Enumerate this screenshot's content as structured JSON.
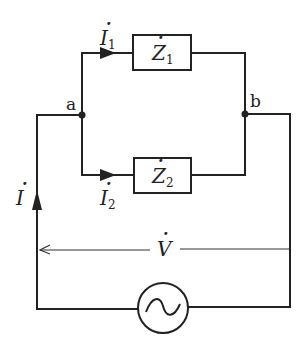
{
  "diagram": {
    "type": "circuit",
    "title": "",
    "nodes": [
      {
        "id": "a",
        "label": "a"
      },
      {
        "id": "b",
        "label": "b"
      }
    ],
    "components": [
      {
        "id": "Z1",
        "type": "impedance",
        "label": "Z",
        "subscript": "1",
        "dotted": true,
        "between": [
          "a",
          "b"
        ],
        "branch": "upper"
      },
      {
        "id": "Z2",
        "type": "impedance",
        "label": "Z",
        "subscript": "2",
        "dotted": true,
        "between": [
          "a",
          "b"
        ],
        "branch": "lower"
      },
      {
        "id": "src",
        "type": "ac-voltage-source",
        "symbol": "~"
      }
    ],
    "currents": [
      {
        "id": "I",
        "label": "I",
        "subscript": "",
        "direction": "up",
        "location": "left outer wire"
      },
      {
        "id": "I1",
        "label": "I",
        "subscript": "1",
        "direction": "right",
        "location": "upper branch"
      },
      {
        "id": "I2",
        "label": "I",
        "subscript": "2",
        "direction": "right",
        "location": "lower branch"
      }
    ],
    "voltage": {
      "label": "V",
      "direction": "left",
      "location": "across source"
    },
    "colors": {
      "line": "#222222",
      "background": "#ffffff"
    }
  }
}
